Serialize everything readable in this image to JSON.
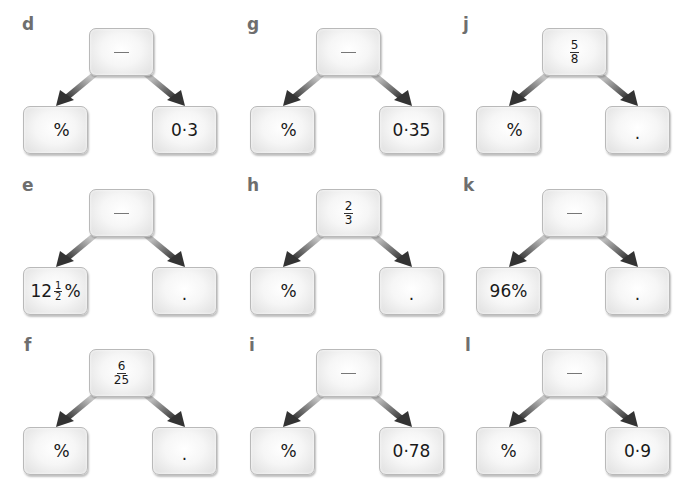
{
  "exercises": [
    {
      "label": "d",
      "top": {
        "type": "blank",
        "text": "—"
      },
      "left": {
        "type": "text",
        "text": "%"
      },
      "right": {
        "type": "text",
        "text": "0·3"
      }
    },
    {
      "label": "e",
      "top": {
        "type": "blank",
        "text": "—"
      },
      "left": {
        "type": "mixed",
        "whole": "12",
        "num": "1",
        "den": "2",
        "suffix": "%"
      },
      "right": {
        "type": "text",
        "text": "."
      }
    },
    {
      "label": "f",
      "top": {
        "type": "fraction",
        "num": "6",
        "den": "25"
      },
      "left": {
        "type": "text",
        "text": "%"
      },
      "right": {
        "type": "text",
        "text": "."
      }
    },
    {
      "label": "g",
      "top": {
        "type": "blank",
        "text": "—"
      },
      "left": {
        "type": "text",
        "text": "%"
      },
      "right": {
        "type": "text",
        "text": "0·35"
      }
    },
    {
      "label": "h",
      "top": {
        "type": "fraction",
        "num": "2",
        "den": "3"
      },
      "left": {
        "type": "text",
        "text": "%"
      },
      "right": {
        "type": "text",
        "text": "."
      }
    },
    {
      "label": "i",
      "top": {
        "type": "blank",
        "text": "—"
      },
      "left": {
        "type": "text",
        "text": "%"
      },
      "right": {
        "type": "text",
        "text": "0·78"
      }
    },
    {
      "label": "j",
      "top": {
        "type": "fraction",
        "num": "5",
        "den": "8"
      },
      "left": {
        "type": "text",
        "text": "%"
      },
      "right": {
        "type": "text",
        "text": "."
      }
    },
    {
      "label": "k",
      "top": {
        "type": "blank",
        "text": "—"
      },
      "left": {
        "type": "text",
        "text": "96%"
      },
      "right": {
        "type": "text",
        "text": "."
      }
    },
    {
      "label": "l",
      "top": {
        "type": "blank",
        "text": "—"
      },
      "left": {
        "type": "text",
        "text": "%"
      },
      "right": {
        "type": "text",
        "text": "0·9"
      }
    }
  ],
  "colors": {
    "label": "#6e6e6e",
    "box_border": "#b9b9b9",
    "arrow": "#3a3a3a"
  }
}
